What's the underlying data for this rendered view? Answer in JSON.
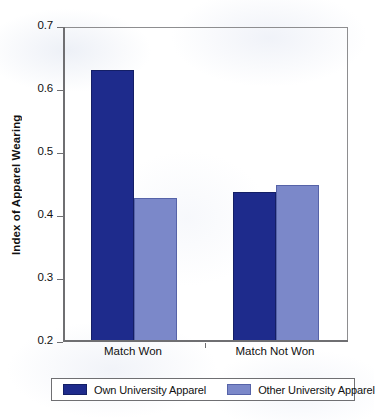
{
  "chart_data": {
    "type": "bar",
    "title": "",
    "xlabel": "",
    "ylabel": "Index of Apparel Wearing",
    "categories": [
      "Match Won",
      "Match Not Won"
    ],
    "series": [
      {
        "name": "Own University Apparel",
        "color": "#1e2b8c",
        "values": [
          0.63,
          0.437
        ]
      },
      {
        "name": "Other University Apparel",
        "color": "#7b88c9",
        "values": [
          0.427,
          0.447
        ]
      }
    ],
    "ylim": [
      0.2,
      0.7
    ],
    "yticks": [
      "0.2",
      "0.3",
      "0.4",
      "0.5",
      "0.6",
      "0.7"
    ],
    "ytick_values": [
      0.2,
      0.3,
      0.4,
      0.5,
      0.6,
      0.7
    ],
    "grid": false,
    "legend_position": "bottom"
  },
  "axes": {
    "y_title": "Index of Apparel Wearing",
    "tick_0": "0.2",
    "tick_1": "0.3",
    "tick_2": "0.4",
    "tick_3": "0.5",
    "tick_4": "0.6",
    "tick_5": "0.7"
  },
  "categories": {
    "c0": "Match Won",
    "c1": "Match Not Won"
  },
  "legend": {
    "item0": "Own University Apparel",
    "item1": "Other University Apparel"
  }
}
